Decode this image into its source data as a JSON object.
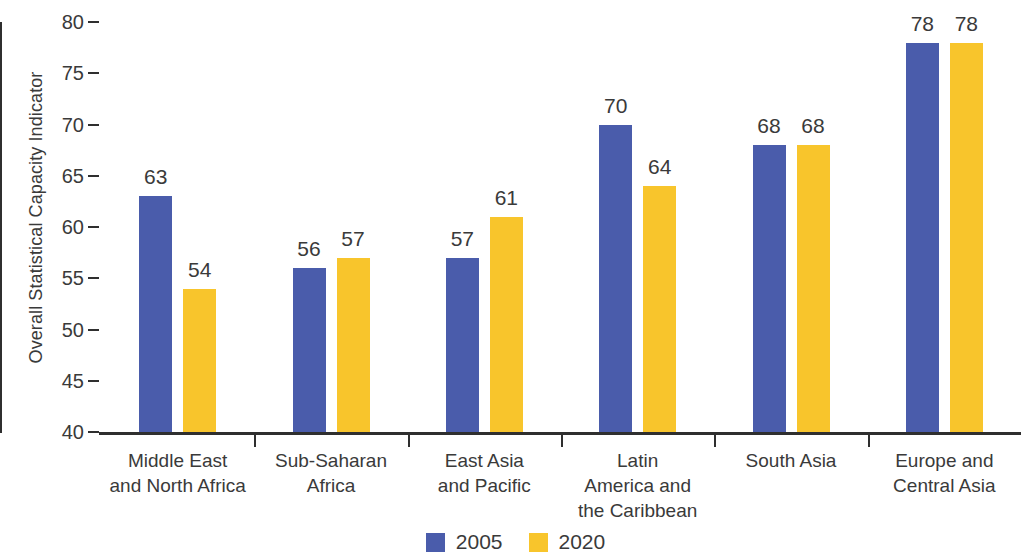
{
  "chart_data": {
    "type": "bar",
    "title": "",
    "xlabel": "",
    "ylabel": "Overall Statistical Capacity Indicator",
    "ylim": [
      40,
      80
    ],
    "ytick_step": 5,
    "yticks": [
      40,
      45,
      50,
      55,
      60,
      65,
      70,
      75,
      80
    ],
    "ytick_labels": [
      "40",
      "45",
      "50",
      "55",
      "60",
      "65",
      "70",
      "75",
      "80"
    ],
    "grid": false,
    "legend_position": "bottom-center",
    "categories": [
      "Middle East\nand North Africa",
      "Sub-Saharan\nAfrica",
      "East Asia\nand Pacific",
      "Latin\nAmerica and\nthe Caribbean",
      "South Asia",
      "Europe and\nCentral Asia"
    ],
    "category_lines": [
      [
        "Middle East",
        "and North Africa"
      ],
      [
        "Sub-Saharan",
        "Africa"
      ],
      [
        "East Asia",
        "and Pacific"
      ],
      [
        "Latin",
        "America and",
        "the Caribbean"
      ],
      [
        "South Asia"
      ],
      [
        "Europe and",
        "Central Asia"
      ]
    ],
    "series": [
      {
        "name": "2005",
        "color": "#4a5cab",
        "values": [
          63,
          56,
          57,
          70,
          68,
          78
        ],
        "labels": [
          "63",
          "56",
          "57",
          "70",
          "68",
          "78"
        ]
      },
      {
        "name": "2020",
        "color": "#f8c52c",
        "values": [
          54,
          57,
          61,
          64,
          68,
          78
        ],
        "labels": [
          "54",
          "57",
          "61",
          "64",
          "68",
          "78"
        ]
      }
    ]
  },
  "legend": {
    "items": [
      {
        "label": "2005",
        "color": "#4a5cab"
      },
      {
        "label": "2020",
        "color": "#f8c52c"
      }
    ]
  },
  "colors": {
    "series_2005": "#4a5cab",
    "series_2020": "#f8c52c",
    "axis": "#2f2f2f",
    "text": "#3a3a3a",
    "background": "#ffffff"
  }
}
